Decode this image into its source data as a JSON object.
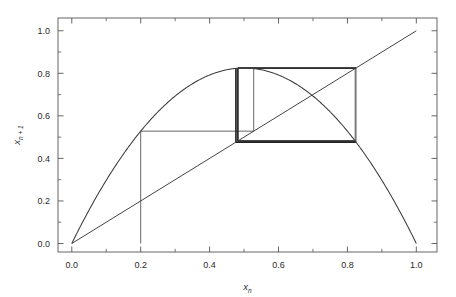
{
  "figure": {
    "background_color": "#ffffff",
    "frame_color": "#555555",
    "curve_color": "#3a3a3a",
    "diagonal_color": "#3a3a3a",
    "cobweb_color": "#4a4a4a",
    "cobweb_heavy_color": "#222222"
  },
  "axes": {
    "x_title_base": "x",
    "x_title_sub": "n",
    "y_title_base": "x",
    "y_title_sub": "n + 1",
    "x_ticks": [
      "0.0",
      "0.2",
      "0.4",
      "0.6",
      "0.8",
      "1.0"
    ],
    "y_ticks": [
      "0.0",
      "0.2",
      "0.4",
      "0.6",
      "0.8",
      "1.0"
    ],
    "x_tick_values": [
      0.0,
      0.2,
      0.4,
      0.6,
      0.8,
      1.0
    ],
    "y_tick_values": [
      0.0,
      0.2,
      0.4,
      0.6,
      0.8,
      1.0
    ],
    "x_minor_values": [
      0.1,
      0.3,
      0.5,
      0.7,
      0.9
    ],
    "y_minor_values": [
      0.1,
      0.3,
      0.5,
      0.7,
      0.9
    ],
    "xlim": [
      -0.04,
      1.06
    ],
    "ylim": [
      -0.04,
      1.06
    ]
  },
  "chart_data": {
    "type": "line",
    "title": "",
    "xlabel": "x_n",
    "ylabel": "x_{n+1}",
    "xlim": [
      -0.04,
      1.06
    ],
    "ylim": [
      -0.04,
      1.06
    ],
    "grid": false,
    "legend": "none",
    "series": [
      {
        "name": "logistic map f(x) = r x (1 - x)",
        "kind": "curve",
        "r": 3.3,
        "peak": {
          "x": 0.5,
          "y": 0.825
        },
        "x": [
          0.0,
          0.05,
          0.1,
          0.15,
          0.2,
          0.25,
          0.3,
          0.35,
          0.4,
          0.45,
          0.5,
          0.55,
          0.6,
          0.65,
          0.7,
          0.75,
          0.8,
          0.85,
          0.9,
          0.95,
          1.0
        ],
        "values": [
          0.0,
          0.1568,
          0.297,
          0.4208,
          0.528,
          0.6188,
          0.693,
          0.7508,
          0.792,
          0.8168,
          0.825,
          0.8168,
          0.792,
          0.7508,
          0.693,
          0.6188,
          0.528,
          0.4208,
          0.297,
          0.1568,
          0.0
        ]
      },
      {
        "name": "identity line y = x",
        "kind": "diagonal",
        "x": [
          0.0,
          1.0
        ],
        "values": [
          0.0,
          1.0
        ]
      },
      {
        "name": "cobweb iteration path",
        "kind": "cobweb",
        "x0": 0.2,
        "points": [
          [
            0.2,
            0.0
          ],
          [
            0.2,
            0.528
          ],
          [
            0.528,
            0.528
          ],
          [
            0.528,
            0.8225
          ],
          [
            0.8225,
            0.8225
          ],
          [
            0.8225,
            0.482
          ],
          [
            0.482,
            0.482
          ],
          [
            0.482,
            0.825
          ],
          [
            0.825,
            0.825
          ],
          [
            0.825,
            0.4764
          ],
          [
            0.4764,
            0.4764
          ],
          [
            0.4764,
            0.8234
          ]
        ]
      }
    ]
  }
}
